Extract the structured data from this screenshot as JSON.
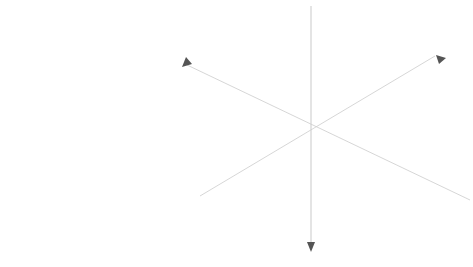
{
  "small_hex": {
    "center_cell": "black",
    "cells": [
      {
        "row": 0,
        "orient": "down",
        "col": 0,
        "label": "2"
      },
      {
        "row": 0,
        "orient": "up",
        "col": 1,
        "label": "3"
      },
      {
        "row": 0,
        "orient": "down",
        "col": 1,
        "label": "2"
      },
      {
        "row": 1,
        "orient": "down",
        "col": 0,
        "label": "2"
      },
      {
        "row": 1,
        "orient": "up",
        "col": 0,
        "label": "1"
      },
      {
        "row": 1,
        "orient": "black",
        "col": 1,
        "label": ""
      },
      {
        "row": 1,
        "orient": "up",
        "col": 1,
        "label": "1"
      },
      {
        "row": 1,
        "orient": "down",
        "col": 2,
        "label": "2"
      },
      {
        "row": 2,
        "orient": "up",
        "col": 0,
        "label": "3"
      },
      {
        "row": 2,
        "orient": "down",
        "col": 0,
        "label": "2"
      },
      {
        "row": 2,
        "orient": "up",
        "col": 1,
        "label": "1"
      },
      {
        "row": 2,
        "orient": "down",
        "col": 1,
        "label": "2"
      },
      {
        "row": 2,
        "orient": "up",
        "col": 2,
        "label": "3"
      }
    ]
  },
  "big_hex": {
    "axes": {
      "x": "x",
      "y": "y",
      "z": "z"
    },
    "cells": [
      {
        "row": 0,
        "dir": "down",
        "cx": 239,
        "label": "(0,-2, 3)",
        "shaded": true
      },
      {
        "row": 0,
        "dir": "down",
        "cx": 287,
        "label": "(1,-2, 2)",
        "shaded": false
      },
      {
        "row": 0,
        "dir": "down",
        "cx": 335,
        "label": "(2,-2, 1)",
        "shaded": false
      },
      {
        "row": 0,
        "dir": "down",
        "cx": 383,
        "label": "(3,-2, 0)",
        "shaded": true
      },
      {
        "row": 0,
        "dir": "up",
        "cx": 215,
        "label": "(-1,-2, 3)",
        "shaded": false
      },
      {
        "row": 0,
        "dir": "up",
        "cx": 263,
        "label": "(0,-2, 2)",
        "shaded": true
      },
      {
        "row": 0,
        "dir": "up",
        "cx": 311,
        "label": "(1,-2, 1)",
        "shaded": false
      },
      {
        "row": 0,
        "dir": "up",
        "cx": 359,
        "label": "(2,-2, 0)",
        "shaded": true
      },
      {
        "row": 0,
        "dir": "up",
        "cx": 407,
        "label": "(3,-2,-1)",
        "shaded": false
      },
      {
        "row": 1,
        "dir": "down",
        "cx": 215,
        "label": "(-1,-1, 3)",
        "shaded": false
      },
      {
        "row": 1,
        "dir": "down",
        "cx": 263,
        "label": "(0,-1, 2)",
        "shaded": true
      },
      {
        "row": 1,
        "dir": "down",
        "cx": 311,
        "label": "(1,-1, 1)",
        "shaded": false
      },
      {
        "row": 1,
        "dir": "down",
        "cx": 359,
        "label": "(2,-1, 0)",
        "shaded": true
      },
      {
        "row": 1,
        "dir": "down",
        "cx": 407,
        "label": "(3,-1,-1)",
        "shaded": false
      },
      {
        "row": 1,
        "dir": "up",
        "cx": 191,
        "label": "(-2,-1, 3)",
        "shaded": false
      },
      {
        "row": 1,
        "dir": "up",
        "cx": 239,
        "label": "(-1,-1, 2)",
        "shaded": false
      },
      {
        "row": 1,
        "dir": "up",
        "cx": 287,
        "label": "(0,-1, 1)",
        "shaded": true
      },
      {
        "row": 1,
        "dir": "up",
        "cx": 335,
        "label": "(1,-1, 0)",
        "shaded": true
      },
      {
        "row": 1,
        "dir": "up",
        "cx": 383,
        "label": "(2,-1,-1)",
        "shaded": false
      },
      {
        "row": 1,
        "dir": "up",
        "cx": 431,
        "label": "(3,-1,-2)",
        "shaded": false
      },
      {
        "row": 2,
        "dir": "down",
        "cx": 191,
        "label": "(-2, 0, 3)",
        "shaded": true
      },
      {
        "row": 2,
        "dir": "down",
        "cx": 239,
        "label": "(-1, 0, 2)",
        "shaded": true
      },
      {
        "row": 2,
        "dir": "down",
        "cx": 287,
        "label": "(0, 0, 1)",
        "shaded": true
      },
      {
        "row": 2,
        "dir": "down",
        "cx": 335,
        "label": "(1, 0, 0)",
        "shaded": true
      },
      {
        "row": 2,
        "dir": "down",
        "cx": 383,
        "label": "(2, 0,-1)",
        "shaded": true
      },
      {
        "row": 2,
        "dir": "down",
        "cx": 431,
        "label": "(3, 0,-2)",
        "shaded": true
      },
      {
        "row": 2,
        "dir": "up",
        "cx": 215,
        "label": "(-2, 0, 2)",
        "shaded": true
      },
      {
        "row": 2,
        "dir": "up",
        "cx": 263,
        "label": "(-1, 0, 1)",
        "shaded": true
      },
      {
        "row": 2,
        "dir": "up",
        "cx": 311,
        "label": "(0, 0, 0)",
        "shaded": true
      },
      {
        "row": 2,
        "dir": "up",
        "cx": 359,
        "label": "(1, 0,-1)",
        "shaded": true
      },
      {
        "row": 2,
        "dir": "up",
        "cx": 407,
        "label": "(2, 0,-2)",
        "shaded": true
      },
      {
        "row": 3,
        "dir": "down",
        "cx": 215,
        "label": "(-2, 1, 2)",
        "shaded": false
      },
      {
        "row": 3,
        "dir": "down",
        "cx": 263,
        "label": "(-1, 1, 1)",
        "shaded": false
      },
      {
        "row": 3,
        "dir": "down",
        "cx": 311,
        "label": "(0, 1, 0)",
        "shaded": true
      },
      {
        "row": 3,
        "dir": "down",
        "cx": 359,
        "label": "(1, 1,-1)",
        "shaded": false
      },
      {
        "row": 3,
        "dir": "down",
        "cx": 407,
        "label": "(2, 1,-2)",
        "shaded": false
      },
      {
        "row": 3,
        "dir": "up",
        "cx": 239,
        "label": "(-2, 1, 1)",
        "shaded": false
      },
      {
        "row": 3,
        "dir": "up",
        "cx": 287,
        "label": "(-1, 1, 0)",
        "shaded": true
      },
      {
        "row": 3,
        "dir": "up",
        "cx": 335,
        "label": "(0, 1,-1)",
        "shaded": true
      },
      {
        "row": 3,
        "dir": "up",
        "cx": 383,
        "label": "(1, 1,-2)",
        "shaded": false
      },
      {
        "row": 4,
        "dir": "down",
        "cx": 239,
        "label": "(-2, 2, 1)",
        "shaded": false
      },
      {
        "row": 4,
        "dir": "down",
        "cx": 287,
        "label": "(-1, 2, 0)",
        "shaded": true
      },
      {
        "row": 4,
        "dir": "down",
        "cx": 335,
        "label": "(0, 2,-1)",
        "shaded": true
      },
      {
        "row": 4,
        "dir": "down",
        "cx": 383,
        "label": "(1, 2,-2)",
        "shaded": false
      },
      {
        "row": 4,
        "dir": "up",
        "cx": 263,
        "label": "(-2, 2, 0)",
        "shaded": true
      },
      {
        "row": 4,
        "dir": "up",
        "cx": 311,
        "label": "(-1, 2,-1)",
        "shaded": false
      },
      {
        "row": 4,
        "dir": "up",
        "cx": 359,
        "label": "(0, 2,-2)",
        "shaded": true
      }
    ]
  }
}
